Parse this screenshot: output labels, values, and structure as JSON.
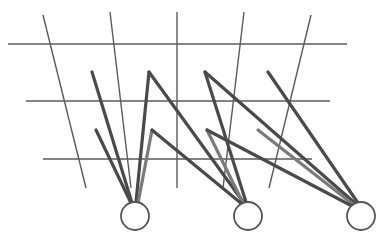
{
  "diagram": {
    "type": "network-grid",
    "canvas": {
      "width": 384,
      "height": 237,
      "background": "#ffffff"
    },
    "colors": {
      "grid": "#5a5a5a",
      "edge": "#4a4a4a",
      "edge_light": "#7a7a7a",
      "node_stroke": "#555555",
      "node_fill": "#ffffff"
    },
    "grid": {
      "horizontal": [
        {
          "x1": 8,
          "y1": 44,
          "x2": 347,
          "y2": 44
        },
        {
          "x1": 26,
          "y1": 101,
          "x2": 330,
          "y2": 101
        },
        {
          "x1": 43,
          "y1": 159,
          "x2": 312,
          "y2": 159
        }
      ],
      "vertical": [
        {
          "x1": 43,
          "y1": 15,
          "x2": 86,
          "y2": 188
        },
        {
          "x1": 110,
          "y1": 12,
          "x2": 131,
          "y2": 188
        },
        {
          "x1": 177,
          "y1": 12,
          "x2": 177,
          "y2": 188
        },
        {
          "x1": 244,
          "y1": 12,
          "x2": 223,
          "y2": 188
        },
        {
          "x1": 311,
          "y1": 15,
          "x2": 269,
          "y2": 188
        }
      ]
    },
    "nodes": [
      {
        "id": "node-1",
        "cx": 135,
        "cy": 216,
        "r": 14
      },
      {
        "id": "node-2",
        "cx": 248,
        "cy": 216,
        "r": 14
      },
      {
        "id": "node-3",
        "cx": 361,
        "cy": 216,
        "r": 14
      }
    ],
    "edges": [
      {
        "x1": 92,
        "y1": 72,
        "x2": 132,
        "y2": 203,
        "tone": "edge"
      },
      {
        "x1": 96,
        "y1": 130,
        "x2": 131,
        "y2": 203,
        "tone": "edge"
      },
      {
        "x1": 149,
        "y1": 72,
        "x2": 136,
        "y2": 202,
        "tone": "edge"
      },
      {
        "x1": 152,
        "y1": 130,
        "x2": 138,
        "y2": 203,
        "tone": "edge_light"
      },
      {
        "x1": 149,
        "y1": 72,
        "x2": 244,
        "y2": 203,
        "tone": "edge"
      },
      {
        "x1": 205,
        "y1": 72,
        "x2": 246,
        "y2": 202,
        "tone": "edge"
      },
      {
        "x1": 207,
        "y1": 130,
        "x2": 243,
        "y2": 203,
        "tone": "edge_light"
      },
      {
        "x1": 152,
        "y1": 130,
        "x2": 242,
        "y2": 204,
        "tone": "edge"
      },
      {
        "x1": 205,
        "y1": 72,
        "x2": 356,
        "y2": 204,
        "tone": "edge"
      },
      {
        "x1": 268,
        "y1": 72,
        "x2": 358,
        "y2": 203,
        "tone": "edge"
      },
      {
        "x1": 258,
        "y1": 130,
        "x2": 354,
        "y2": 205,
        "tone": "edge_light"
      },
      {
        "x1": 207,
        "y1": 130,
        "x2": 352,
        "y2": 206,
        "tone": "edge"
      }
    ]
  }
}
